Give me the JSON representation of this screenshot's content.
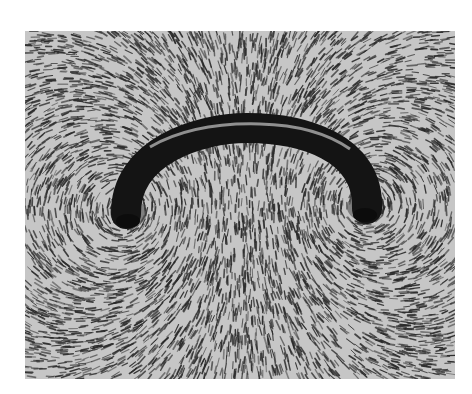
{
  "figure": {
    "colors": {
      "background": "#ffffff",
      "paper": "#c4c4c4",
      "filings": "#2a2a2a",
      "wire": "#151515",
      "wire_highlight": "#bdbdbd"
    },
    "wire": {
      "left_end": [
        101,
        179
      ],
      "right_end": [
        340,
        174
      ],
      "apex": [
        222,
        112
      ],
      "thickness": 30
    }
  }
}
